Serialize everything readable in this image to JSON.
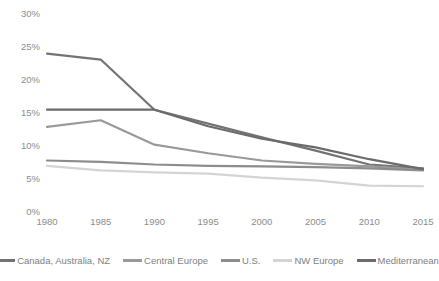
{
  "chart_data": {
    "type": "line",
    "title": "",
    "subtitle": "",
    "xlabel": "",
    "ylabel": "",
    "x": [
      1980,
      1985,
      1990,
      1995,
      2000,
      2005,
      2010,
      2015
    ],
    "categories": [
      "1980",
      "1985",
      "1990",
      "1995",
      "2000",
      "2005",
      "2010",
      "2015"
    ],
    "xlim": [
      1980,
      2015
    ],
    "ylim": [
      0,
      30
    ],
    "y_ticks": [
      0,
      5,
      10,
      15,
      20,
      25,
      30
    ],
    "y_tick_labels": [
      "0%",
      "5%",
      "10%",
      "15%",
      "20%",
      "25%",
      "30%"
    ],
    "x_tick_labels": [
      "1980",
      "1985",
      "1990",
      "1995",
      "2000",
      "2005",
      "2010",
      "2015"
    ],
    "grid": false,
    "legend_position": "bottom",
    "value_suffix": "%",
    "series": [
      {
        "name": "Canada, Australia, NZ",
        "color": "#737373",
        "values": [
          24.0,
          23.1,
          15.5,
          13.4,
          11.3,
          9.3,
          7.2,
          6.6
        ]
      },
      {
        "name": "Central Europe",
        "color": "#999999",
        "values": [
          12.9,
          13.9,
          10.2,
          8.9,
          7.8,
          7.3,
          6.9,
          6.4
        ]
      },
      {
        "name": "U.S.",
        "color": "#8c8c8c",
        "values": [
          7.8,
          7.6,
          7.2,
          7.0,
          6.9,
          6.8,
          6.6,
          6.3
        ]
      },
      {
        "name": "NW Europe",
        "color": "#d4d4d4",
        "values": [
          7.0,
          6.3,
          6.0,
          5.8,
          5.2,
          4.8,
          4.0,
          3.9
        ]
      },
      {
        "name": "Mediterranean",
        "color": "#6b6b6b",
        "values": [
          15.5,
          15.5,
          15.5,
          13.0,
          11.1,
          9.8,
          8.0,
          6.5
        ]
      }
    ]
  },
  "legend": {
    "items": [
      {
        "label": "Canada, Australia, NZ",
        "color": "#737373"
      },
      {
        "label": "Central Europe",
        "color": "#999999"
      },
      {
        "label": "U.S.",
        "color": "#8c8c8c"
      },
      {
        "label": "NW Europe",
        "color": "#d4d4d4"
      },
      {
        "label": "Mediterranean",
        "color": "#6b6b6b"
      }
    ]
  }
}
